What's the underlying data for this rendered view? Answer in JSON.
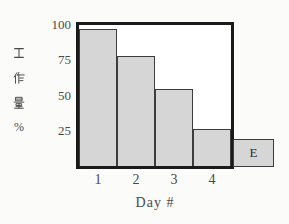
{
  "chart_data": {
    "type": "bar",
    "xlabel": "Day #",
    "ylabel": "工作量%",
    "ylabel_chars": [
      "工",
      "作",
      "量",
      "%"
    ],
    "categories": [
      "1",
      "2",
      "3",
      "4"
    ],
    "values": [
      97,
      78,
      55,
      26
    ],
    "extra_bar": {
      "label": "E",
      "value": 20
    },
    "yticks": [
      100,
      75,
      50,
      25
    ],
    "ylim": [
      0,
      100
    ],
    "grid": false,
    "legend_position": "none"
  },
  "colors": {
    "background": "#fbfbfa",
    "plot_background": "#ffffff",
    "frame": "#1a1a1a",
    "bar_fill": "#d6d6d6",
    "bar_border": "#3d3d3d",
    "text": "#4a4a4a"
  }
}
